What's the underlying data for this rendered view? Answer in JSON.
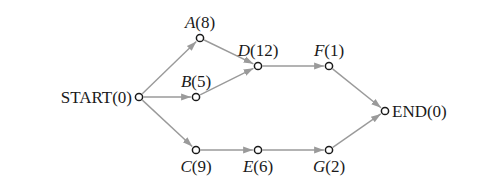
{
  "diagram": {
    "type": "activity-network",
    "nodes": [
      {
        "id": "START",
        "name": "START",
        "duration": "0",
        "label": "START(0)",
        "x": 139,
        "y": 97,
        "italic": false,
        "label_pos": "left"
      },
      {
        "id": "A",
        "name": "A",
        "duration": "8",
        "label": "A(8)",
        "x": 200,
        "y": 38,
        "italic": true,
        "label_pos": "top"
      },
      {
        "id": "B",
        "name": "B",
        "duration": "5",
        "label": "B(5)",
        "x": 196,
        "y": 97,
        "italic": true,
        "label_pos": "top"
      },
      {
        "id": "C",
        "name": "C",
        "duration": "9",
        "label": "C(9)",
        "x": 196,
        "y": 150,
        "italic": true,
        "label_pos": "bottom"
      },
      {
        "id": "D",
        "name": "D",
        "duration": "12",
        "label": "D(12)",
        "x": 258,
        "y": 66,
        "italic": true,
        "label_pos": "top"
      },
      {
        "id": "E",
        "name": "E",
        "duration": "6",
        "label": "E(6)",
        "x": 258,
        "y": 150,
        "italic": true,
        "label_pos": "bottom"
      },
      {
        "id": "F",
        "name": "F",
        "duration": "1",
        "label": "F(1)",
        "x": 329,
        "y": 66,
        "italic": true,
        "label_pos": "top"
      },
      {
        "id": "G",
        "name": "G",
        "duration": "2",
        "label": "G(2)",
        "x": 329,
        "y": 150,
        "italic": true,
        "label_pos": "bottom"
      },
      {
        "id": "END",
        "name": "END",
        "duration": "0",
        "label": "END(0)",
        "x": 385,
        "y": 111,
        "italic": false,
        "label_pos": "right"
      }
    ],
    "edges": [
      {
        "from": "START",
        "to": "A"
      },
      {
        "from": "START",
        "to": "B"
      },
      {
        "from": "START",
        "to": "C"
      },
      {
        "from": "A",
        "to": "D"
      },
      {
        "from": "B",
        "to": "D"
      },
      {
        "from": "D",
        "to": "F"
      },
      {
        "from": "C",
        "to": "E"
      },
      {
        "from": "E",
        "to": "G"
      },
      {
        "from": "F",
        "to": "END"
      },
      {
        "from": "G",
        "to": "END"
      }
    ],
    "colors": {
      "edge": "#9a9a9a",
      "node_stroke": "#1a1a1a",
      "text": "#1a1a1a",
      "background": "#ffffff"
    }
  }
}
